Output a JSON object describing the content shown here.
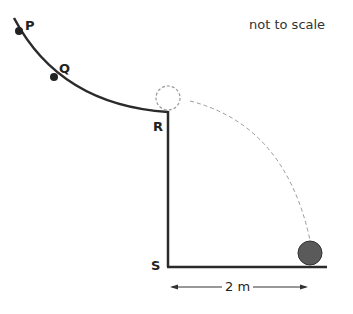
{
  "diagram": {
    "note": "not to scale",
    "points": {
      "P": "P",
      "Q": "Q",
      "R": "R",
      "S": "S"
    },
    "distance_label": "2 m",
    "colors": {
      "line": "#2a2a2a",
      "dashed": "#999999",
      "ball_fill": "#5a5a5a"
    }
  }
}
